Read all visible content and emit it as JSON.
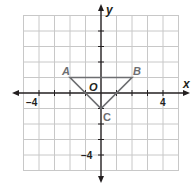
{
  "diagram": {
    "type": "coordinate-plane",
    "axes": {
      "x_label": "x",
      "y_label": "y",
      "origin_label": "O",
      "x_range": [
        -5,
        5
      ],
      "y_range": [
        -5,
        5
      ]
    },
    "tick_labels": {
      "x_neg": "−4",
      "x_pos": "4",
      "y_neg": "−4"
    },
    "points": [
      {
        "name": "A",
        "x": -2,
        "y": 1
      },
      {
        "name": "B",
        "x": 2,
        "y": 1
      },
      {
        "name": "C",
        "x": 0,
        "y": -1
      }
    ],
    "shape": "triangle ABC",
    "colors": {
      "grid": "#c8c8c8",
      "axis": "#231f20",
      "triangle": "#6d6e71",
      "point_label": "#6d6e71"
    }
  }
}
